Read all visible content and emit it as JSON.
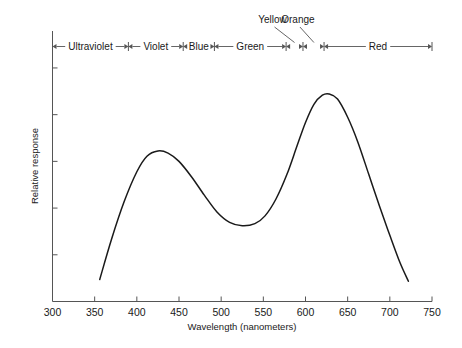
{
  "chart_data": {
    "type": "line",
    "title": "",
    "xlabel": "Wavelength (nanometers)",
    "ylabel": "Relative response",
    "xlim": [
      300,
      750
    ],
    "ylim": [
      0,
      1
    ],
    "grid": false,
    "legend": "none",
    "xticks": [
      300,
      350,
      400,
      450,
      500,
      550,
      600,
      650,
      700,
      750
    ],
    "xtick_labels": [
      "300",
      "350",
      "400",
      "450",
      "500",
      "550",
      "600",
      "650",
      "700",
      "750"
    ],
    "yticks": [
      0.18,
      0.36,
      0.54,
      0.72,
      0.9
    ],
    "ytick_labels": [
      "",
      "",
      "",
      "",
      ""
    ],
    "series": [
      {
        "name": "Relative response",
        "x": [
          356,
          370,
          385,
          400,
          412,
          425,
          437,
          450,
          465,
          480,
          495,
          510,
          525,
          540,
          552,
          565,
          578,
          590,
          600,
          610,
          620,
          628,
          638,
          650,
          662,
          675,
          688,
          700,
          712,
          722
        ],
        "values": [
          0.085,
          0.24,
          0.385,
          0.5,
          0.56,
          0.58,
          0.572,
          0.54,
          0.48,
          0.41,
          0.345,
          0.305,
          0.292,
          0.3,
          0.33,
          0.395,
          0.49,
          0.6,
          0.69,
          0.76,
          0.795,
          0.8,
          0.78,
          0.71,
          0.615,
          0.49,
          0.365,
          0.255,
          0.15,
          0.078
        ]
      }
    ],
    "spectrum_bands": [
      {
        "name": "Ultraviolet",
        "label": "Ultraviolet",
        "start": 300,
        "end": 390
      },
      {
        "name": "Violet",
        "label": "Violet",
        "start": 390,
        "end": 455
      },
      {
        "name": "Blue",
        "label": "Blue",
        "start": 455,
        "end": 492
      },
      {
        "name": "Green",
        "label": "Green",
        "start": 492,
        "end": 577
      },
      {
        "name": "Yellow",
        "label": "Yellow",
        "start": 577,
        "end": 597
      },
      {
        "name": "Orange",
        "label": "Orange",
        "start": 597,
        "end": 622
      },
      {
        "name": "Red",
        "label": "Red",
        "start": 622,
        "end": 750
      }
    ],
    "annotations": [
      {
        "name": "yellow-callout",
        "label": "Yellow",
        "points_to": 587
      },
      {
        "name": "orange-callout",
        "label": "Orange",
        "points_to": 610
      }
    ],
    "colors": {
      "curve": "#1a1a1a",
      "axis": "#555555",
      "band_line": "#555555",
      "background": "#ffffff"
    },
    "peaks": [
      {
        "name": "first-peak",
        "x": 425,
        "y": 0.58
      },
      {
        "name": "second-peak",
        "x": 628,
        "y": 0.8
      }
    ],
    "trough": {
      "name": "trough",
      "x": 525,
      "y": 0.292
    }
  }
}
